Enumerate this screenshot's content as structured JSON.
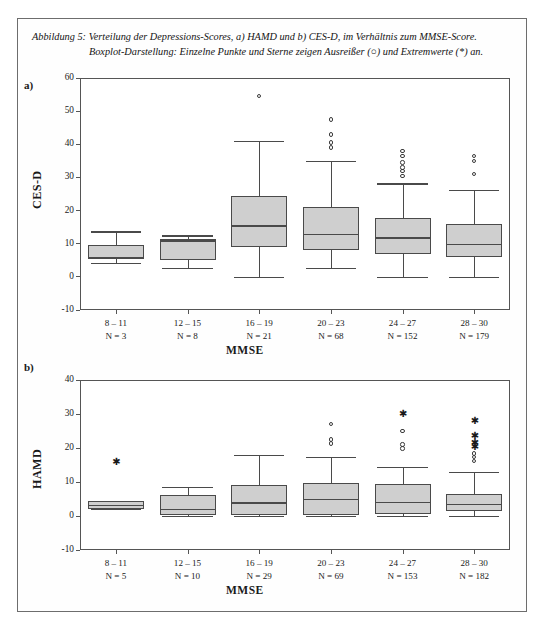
{
  "figure": {
    "caption_line1": "Abbildung 5: Verteilung der Depressions-Scores, a) HAMD und b) CES-D, im Verhältnis zum MMSE-Score.",
    "caption_line2": "Boxplot-Darstellung: Einzelne Punkte und Sterne zeigen Ausreißer (○) und Extremwerte (*) an.",
    "border_color": "#6d6d6d",
    "box_fill_color": "#cfcfcf",
    "line_color": "#4a4a4a"
  },
  "chart_data": [
    {
      "type": "box",
      "panel_letter": "a)",
      "title": "",
      "ylabel": "CES-D",
      "xlabel": "MMSE",
      "ylim": [
        -10,
        60
      ],
      "yticks": [
        -10,
        0,
        10,
        20,
        30,
        40,
        50,
        60
      ],
      "ytick_labels": [
        "-10",
        "0",
        "10",
        "20",
        "30",
        "40",
        "50",
        "60"
      ],
      "grid": false,
      "categories": [
        "8 – 11",
        "12 – 15",
        "16 – 19",
        "20 – 23",
        "24 – 27",
        "28 – 30"
      ],
      "counts": [
        "N = 3",
        "N = 8",
        "N = 21",
        "N = 68",
        "N = 152",
        "N = 179"
      ],
      "boxes": [
        {
          "category": "8 – 11",
          "whisker_low": 4.2,
          "q1": 5.6,
          "median": 5.8,
          "q3": 9.7,
          "whisker_high": 13.7,
          "outliers": [],
          "extremes": []
        },
        {
          "category": "12 – 15",
          "whisker_low": 2.8,
          "q1": 5.1,
          "median": 11.0,
          "q3": 11.4,
          "whisker_high": 12.5,
          "outliers": [],
          "extremes": []
        },
        {
          "category": "16 – 19",
          "whisker_low": 0.0,
          "q1": 9.0,
          "median": 15.6,
          "q3": 24.3,
          "whisker_high": 41.0,
          "outliers": [
            54.5
          ],
          "extremes": []
        },
        {
          "category": "20 – 23",
          "whisker_low": 2.6,
          "q1": 8.1,
          "median": 13.0,
          "q3": 21.0,
          "whisker_high": 35.0,
          "outliers": [
            47.5,
            43.0,
            40.5,
            39.0
          ],
          "extremes": []
        },
        {
          "category": "24 – 27",
          "whisker_low": 0.0,
          "q1": 7.0,
          "median": 11.9,
          "q3": 17.8,
          "whisker_high": 28.2,
          "outliers": [
            38.0,
            36.5,
            34.5,
            33.0,
            32.0,
            30.5
          ],
          "extremes": []
        },
        {
          "category": "28 – 30",
          "whisker_low": 0.0,
          "q1": 5.9,
          "median": 10.0,
          "q3": 15.9,
          "whisker_high": 26.2,
          "outliers": [
            36.5,
            35.0,
            31.0
          ],
          "extremes": []
        }
      ]
    },
    {
      "type": "box",
      "panel_letter": "b)",
      "title": "",
      "ylabel": "HAMD",
      "xlabel": "MMSE",
      "ylim": [
        -10,
        40
      ],
      "yticks": [
        -10,
        0,
        10,
        20,
        30,
        40
      ],
      "ytick_labels": [
        "-10",
        "0",
        "10",
        "20",
        "30",
        "40"
      ],
      "grid": false,
      "categories": [
        "8 – 11",
        "12 – 15",
        "16 – 19",
        "20 – 23",
        "24 – 27",
        "28 – 30"
      ],
      "counts": [
        "N = 5",
        "N = 10",
        "N = 29",
        "N = 69",
        "N = 153",
        "N = 182"
      ],
      "boxes": [
        {
          "category": "8 – 11",
          "whisker_low": 2.0,
          "q1": 2.2,
          "median": 3.3,
          "q3": 4.3,
          "whisker_high": 4.4,
          "outliers": [],
          "extremes": [
            15.3
          ]
        },
        {
          "category": "12 – 15",
          "whisker_low": 0.0,
          "q1": 0.2,
          "median": 2.2,
          "q3": 6.2,
          "whisker_high": 8.5,
          "outliers": [],
          "extremes": []
        },
        {
          "category": "16 – 19",
          "whisker_low": 0.0,
          "q1": 0.2,
          "median": 4.0,
          "q3": 9.0,
          "whisker_high": 18.0,
          "outliers": [],
          "extremes": []
        },
        {
          "category": "20 – 23",
          "whisker_low": 0.0,
          "q1": 0.3,
          "median": 5.0,
          "q3": 9.6,
          "whisker_high": 17.5,
          "outliers": [
            27.0,
            22.5,
            21.3
          ],
          "extremes": []
        },
        {
          "category": "24 – 27",
          "whisker_low": 0.0,
          "q1": 0.5,
          "median": 4.2,
          "q3": 9.3,
          "whisker_high": 14.5,
          "outliers": [
            25.0,
            21.0,
            19.8
          ],
          "extremes": [
            29.5
          ]
        },
        {
          "category": "28 – 30",
          "whisker_low": 0.0,
          "q1": 1.5,
          "median": 3.5,
          "q3": 6.6,
          "whisker_high": 12.9,
          "outliers": [
            18.4,
            17.4,
            16.2
          ],
          "extremes": [
            27.5,
            22.8,
            20.8,
            19.6
          ]
        }
      ]
    }
  ]
}
